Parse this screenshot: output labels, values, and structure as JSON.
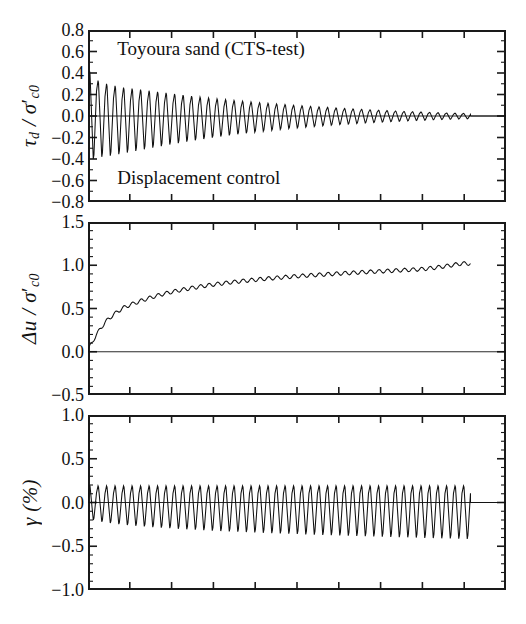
{
  "figure": {
    "background": "#ffffff",
    "ink_color": "#111111",
    "panel_left_px": 88,
    "panel_right_px": 506,
    "annotations": [
      {
        "text": "Toyoura sand (CTS-test)",
        "panel": 0,
        "x_frac": 0.07,
        "y_value": 0.6
      },
      {
        "text": "Displacement control",
        "panel": 0,
        "x_frac": 0.07,
        "y_value": -0.6
      }
    ]
  },
  "chart_data": [
    {
      "type": "line",
      "panel_index": 0,
      "title": "Toyoura sand (CTS-test)",
      "subtitle": "Displacement control",
      "xlabel": "",
      "ylabel": "tau_d / sigma'_c0",
      "ylabel_parts": {
        "greek": "τ",
        "sub1": "d",
        "sep": " / ",
        "greek2": "σ",
        "prime": "′",
        "sub2": "c0"
      },
      "ylim": [
        -0.8,
        0.8
      ],
      "yticks": [
        0.8,
        0.6,
        0.4,
        0.2,
        0.0,
        -0.2,
        -0.4,
        -0.6,
        -0.8
      ],
      "ytick_labels": [
        "0.8",
        "0.6",
        "0.4",
        "0.2",
        "0.0",
        "-0.2",
        "-0.4",
        "-0.6",
        "-0.8"
      ],
      "minor_ticks_per_interval": 1,
      "xlim": [
        0,
        100
      ],
      "x_major_ticks": 10,
      "grid": false,
      "legend": "none",
      "series": [
        {
          "name": "shear stress ratio",
          "waveform": "decaying-sawtooth",
          "cycles": 45,
          "data_end_x_frac": 0.915,
          "envelope_positive": [
            0.42,
            0.33,
            0.3,
            0.28,
            0.265,
            0.255,
            0.245,
            0.235,
            0.225,
            0.215,
            0.205,
            0.195,
            0.185,
            0.176,
            0.168,
            0.16,
            0.152,
            0.145,
            0.138,
            0.131,
            0.124,
            0.118,
            0.112,
            0.106,
            0.1,
            0.095,
            0.09,
            0.085,
            0.08,
            0.075,
            0.07,
            0.066,
            0.062,
            0.058,
            0.054,
            0.05,
            0.046,
            0.043,
            0.04,
            0.037,
            0.034,
            0.031,
            0.028,
            0.026,
            0.024
          ],
          "envelope_negative": [
            -0.4,
            -0.38,
            -0.37,
            -0.355,
            -0.34,
            -0.325,
            -0.31,
            -0.295,
            -0.28,
            -0.266,
            -0.252,
            -0.239,
            -0.226,
            -0.214,
            -0.202,
            -0.191,
            -0.18,
            -0.17,
            -0.16,
            -0.151,
            -0.142,
            -0.134,
            -0.126,
            -0.118,
            -0.111,
            -0.104,
            -0.098,
            -0.092,
            -0.086,
            -0.08,
            -0.075,
            -0.07,
            -0.065,
            -0.061,
            -0.057,
            -0.053,
            -0.049,
            -0.045,
            -0.042,
            -0.039,
            -0.036,
            -0.033,
            -0.03,
            -0.028,
            -0.026
          ]
        }
      ]
    },
    {
      "type": "line",
      "panel_index": 1,
      "title": "",
      "xlabel": "",
      "ylabel": "delta-u / sigma'_c0",
      "ylabel_parts": {
        "greek": "Δ",
        "ital": "u",
        "sep": " / ",
        "greek2": "σ",
        "prime": "′",
        "sub2": "c0"
      },
      "ylim": [
        -0.5,
        1.5
      ],
      "yticks": [
        1.5,
        1.0,
        0.5,
        0.0,
        -0.5
      ],
      "ytick_labels": [
        "1.5",
        "1.0",
        "0.5",
        "0.0",
        "-0.5"
      ],
      "minor_ticks_per_interval": 4,
      "xlim": [
        0,
        100
      ],
      "x_major_ticks": 10,
      "grid": false,
      "legend": "none",
      "series": [
        {
          "name": "excess pore water pressure ratio",
          "waveform": "rising-with-ripple",
          "cycles": 45,
          "data_end_x_frac": 0.915,
          "zero_line": 0.0,
          "mean_values": [
            0.02,
            0.2,
            0.34,
            0.43,
            0.5,
            0.545,
            0.58,
            0.615,
            0.645,
            0.672,
            0.695,
            0.715,
            0.734,
            0.751,
            0.766,
            0.78,
            0.793,
            0.805,
            0.816,
            0.826,
            0.836,
            0.845,
            0.853,
            0.861,
            0.869,
            0.876,
            0.883,
            0.889,
            0.895,
            0.901,
            0.907,
            0.912,
            0.918,
            0.923,
            0.928,
            0.933,
            0.938,
            0.943,
            0.948,
            0.953,
            0.962,
            0.974,
            0.988,
            1.004,
            1.02
          ],
          "ripple_amplitude": 0.022
        }
      ]
    },
    {
      "type": "line",
      "panel_index": 2,
      "title": "",
      "xlabel": "",
      "ylabel": "gamma (%)",
      "ylabel_parts": {
        "greek": "γ",
        "sep": " (%)"
      },
      "ylim": [
        -1.0,
        1.0
      ],
      "yticks": [
        1.0,
        0.5,
        0.0,
        -0.5,
        -1.0
      ],
      "ytick_labels": [
        "1.0",
        "0.5",
        "0.0",
        "-0.5",
        "-1.0"
      ],
      "minor_ticks_per_interval": 4,
      "xlim": [
        0,
        100
      ],
      "x_major_ticks": 10,
      "grid": false,
      "legend": "none",
      "series": [
        {
          "name": "shear strain",
          "waveform": "constant-amplitude-sawtooth",
          "cycles": 45,
          "data_end_x_frac": 0.915,
          "envelope_positive": [
            0.2,
            0.19,
            0.19,
            0.19,
            0.19,
            0.19,
            0.19,
            0.19,
            0.19,
            0.19,
            0.19,
            0.19,
            0.19,
            0.19,
            0.19,
            0.19,
            0.19,
            0.19,
            0.19,
            0.19,
            0.19,
            0.19,
            0.19,
            0.19,
            0.19,
            0.19,
            0.19,
            0.19,
            0.19,
            0.19,
            0.19,
            0.19,
            0.19,
            0.19,
            0.19,
            0.19,
            0.19,
            0.19,
            0.19,
            0.19,
            0.19,
            0.19,
            0.19,
            0.19,
            0.19
          ],
          "envelope_negative": [
            -0.2,
            -0.22,
            -0.235,
            -0.248,
            -0.258,
            -0.266,
            -0.274,
            -0.281,
            -0.288,
            -0.294,
            -0.3,
            -0.306,
            -0.311,
            -0.316,
            -0.321,
            -0.326,
            -0.33,
            -0.334,
            -0.338,
            -0.342,
            -0.346,
            -0.35,
            -0.354,
            -0.357,
            -0.36,
            -0.364,
            -0.367,
            -0.37,
            -0.373,
            -0.376,
            -0.379,
            -0.382,
            -0.385,
            -0.388,
            -0.39,
            -0.393,
            -0.396,
            -0.398,
            -0.401,
            -0.404,
            -0.406,
            -0.409,
            -0.411,
            -0.414,
            -0.416
          ]
        }
      ]
    }
  ]
}
